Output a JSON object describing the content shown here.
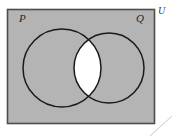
{
  "figure": {
    "kind": "venn-diagram",
    "canvas": {
      "width": 172,
      "height": 136,
      "background": "#ffffff"
    }
  },
  "universal_set": {
    "label": "U",
    "shape": "rectangle",
    "fill_color": "#b4b4b4",
    "stroke_color": "#4d4d4d",
    "x": 7,
    "y": 9,
    "width": 148,
    "height": 115
  },
  "sets": [
    {
      "label": "P",
      "shape": "circle",
      "cx": 62,
      "cy": 68,
      "r": 39,
      "stroke_color": "#1a1a1a",
      "fill_color": "#b4b4b4"
    },
    {
      "label": "Q",
      "shape": "circle",
      "cx": 109,
      "cy": 68,
      "r": 35,
      "stroke_color": "#1a1a1a",
      "fill_color": "#b4b4b4"
    }
  ],
  "shaded_region": {
    "name": "intersection",
    "notation": "P ∩ Q",
    "fill_color": "#ffffff",
    "description": "The lens-shaped overlap of circles P and Q is unshaded (white) while the rest of the universal set is shaded gray."
  },
  "annotations": {
    "corner_line": {
      "name": "page-corner-line",
      "color": "#c8c8c8",
      "x1": 150,
      "y1": 136,
      "x2": 172,
      "y2": 116
    }
  }
}
